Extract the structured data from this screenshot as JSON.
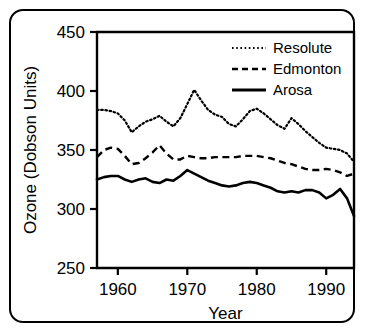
{
  "chart_data": {
    "type": "line",
    "title": "",
    "xlabel": "Year",
    "ylabel": "Ozone (Dobson Units)",
    "xlim": [
      1957,
      1994
    ],
    "ylim": [
      250,
      450
    ],
    "xticks": [
      1960,
      1970,
      1980,
      1990
    ],
    "yticks": [
      250,
      300,
      350,
      400,
      450
    ],
    "xtick_labels": [
      "1960",
      "1970",
      "1980",
      "1990"
    ],
    "ytick_labels": [
      "250",
      "300",
      "350",
      "400",
      "450"
    ],
    "grid": false,
    "legend_position": "top-right",
    "x": [
      1957,
      1958,
      1959,
      1960,
      1961,
      1962,
      1963,
      1964,
      1965,
      1966,
      1967,
      1968,
      1969,
      1970,
      1971,
      1972,
      1973,
      1974,
      1975,
      1976,
      1977,
      1978,
      1979,
      1980,
      1981,
      1982,
      1983,
      1984,
      1985,
      1986,
      1987,
      1988,
      1989,
      1990,
      1991,
      1992,
      1993,
      1994
    ],
    "series": [
      {
        "name": "Resolute",
        "style": "dotted",
        "color": "#000000",
        "values": [
          384,
          384,
          383,
          381,
          375,
          365,
          370,
          374,
          376,
          379,
          374,
          370,
          377,
          389,
          401,
          392,
          384,
          380,
          378,
          372,
          370,
          376,
          383,
          385,
          381,
          376,
          371,
          368,
          377,
          372,
          366,
          361,
          356,
          352,
          351,
          350,
          347,
          340
        ]
      },
      {
        "name": "Edmonton",
        "style": "dashed",
        "color": "#000000",
        "values": [
          344,
          350,
          352,
          351,
          345,
          338,
          339,
          343,
          348,
          354,
          347,
          342,
          342,
          345,
          344,
          343,
          343,
          344,
          344,
          344,
          344,
          345,
          345,
          345,
          344,
          343,
          341,
          339,
          338,
          336,
          334,
          333,
          333,
          334,
          333,
          331,
          328,
          330
        ]
      },
      {
        "name": "Arosa",
        "style": "solid",
        "color": "#000000",
        "values": [
          325,
          327,
          328,
          328,
          325,
          323,
          325,
          326,
          323,
          322,
          325,
          324,
          328,
          333,
          330,
          327,
          324,
          322,
          320,
          319,
          320,
          322,
          323,
          322,
          320,
          318,
          315,
          314,
          315,
          314,
          316,
          316,
          314,
          309,
          312,
          317,
          309,
          294
        ]
      }
    ],
    "legend": [
      {
        "label": "Resolute",
        "style": "dotted"
      },
      {
        "label": "Edmonton",
        "style": "dashed"
      },
      {
        "label": "Arosa",
        "style": "solid"
      }
    ]
  }
}
